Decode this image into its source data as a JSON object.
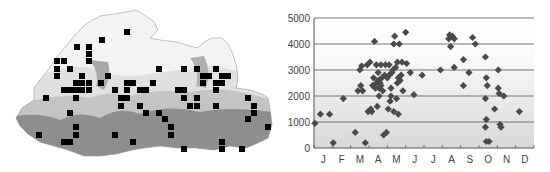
{
  "figure": {
    "left_panel": "Distribution map with grid-square occurrence records over elevation relief",
    "right_panel": "Scatter plot of altitude vs month"
  },
  "map": {
    "relief_colors": {
      "low": "#8a8a8a",
      "mid": "#bdbdbd",
      "high": "#e6e6e6",
      "outline": "#9a9a9a"
    },
    "marker_color": "#000000",
    "markers": [
      [
        127,
        32
      ],
      [
        102,
        40
      ],
      [
        77,
        47
      ],
      [
        89,
        47
      ],
      [
        89,
        54
      ],
      [
        89,
        61
      ],
      [
        57,
        61
      ],
      [
        64,
        61
      ],
      [
        57,
        69
      ],
      [
        70,
        69
      ],
      [
        57,
        76
      ],
      [
        82,
        76
      ],
      [
        108,
        76
      ],
      [
        159,
        69
      ],
      [
        184,
        69
      ],
      [
        197,
        69
      ],
      [
        216,
        69
      ],
      [
        82,
        83
      ],
      [
        76,
        83
      ],
      [
        89,
        83
      ],
      [
        101,
        83
      ],
      [
        127,
        83
      ],
      [
        133,
        83
      ],
      [
        153,
        83
      ],
      [
        203,
        83
      ],
      [
        216,
        83
      ],
      [
        222,
        83
      ],
      [
        222,
        76
      ],
      [
        228,
        76
      ],
      [
        203,
        76
      ],
      [
        209,
        76
      ],
      [
        64,
        90
      ],
      [
        70,
        90
      ],
      [
        76,
        90
      ],
      [
        82,
        90
      ],
      [
        89,
        90
      ],
      [
        115,
        90
      ],
      [
        127,
        90
      ],
      [
        140,
        90
      ],
      [
        146,
        90
      ],
      [
        178,
        90
      ],
      [
        184,
        90
      ],
      [
        216,
        90
      ],
      [
        46,
        98
      ],
      [
        76,
        98
      ],
      [
        121,
        98
      ],
      [
        127,
        98
      ],
      [
        184,
        98
      ],
      [
        197,
        98
      ],
      [
        248,
        98
      ],
      [
        121,
        106
      ],
      [
        140,
        106
      ],
      [
        190,
        106
      ],
      [
        197,
        106
      ],
      [
        216,
        106
      ],
      [
        254,
        106
      ],
      [
        70,
        113
      ],
      [
        146,
        113
      ],
      [
        159,
        113
      ],
      [
        254,
        113
      ],
      [
        165,
        119
      ],
      [
        248,
        119
      ],
      [
        171,
        127
      ],
      [
        76,
        127
      ],
      [
        268,
        127
      ],
      [
        39,
        135
      ],
      [
        76,
        135
      ],
      [
        115,
        135
      ],
      [
        171,
        135
      ],
      [
        64,
        142
      ],
      [
        70,
        142
      ],
      [
        133,
        142
      ],
      [
        222,
        142
      ],
      [
        184,
        149
      ],
      [
        222,
        149
      ],
      [
        242,
        149
      ]
    ]
  },
  "chart_data": {
    "type": "scatter",
    "title": "",
    "xlabel": "",
    "ylabel": "",
    "categories": [
      "J",
      "F",
      "M",
      "A",
      "M",
      "J",
      "J",
      "A",
      "S",
      "O",
      "N",
      "D"
    ],
    "ylim": [
      0,
      5000
    ],
    "yticks": [
      0,
      1000,
      2000,
      3000,
      4000,
      5000
    ],
    "grid": {
      "horizontal": true,
      "vertical": false
    },
    "background": "gradient grey (lighter at top)",
    "marker": "diamond",
    "marker_color": "#4a4a4a",
    "x_unit": "month index (0 = January center)",
    "points": [
      [
        -0.45,
        950
      ],
      [
        -0.15,
        1300
      ],
      [
        0.35,
        1300
      ],
      [
        0.55,
        200
      ],
      [
        1.1,
        1900
      ],
      [
        1.75,
        600
      ],
      [
        1.9,
        2200
      ],
      [
        2.0,
        3000
      ],
      [
        2.05,
        2400
      ],
      [
        2.1,
        3150
      ],
      [
        2.15,
        2200
      ],
      [
        2.3,
        200
      ],
      [
        2.4,
        3200
      ],
      [
        2.45,
        1400
      ],
      [
        2.55,
        3300
      ],
      [
        2.6,
        1500
      ],
      [
        2.65,
        1400
      ],
      [
        2.7,
        2400
      ],
      [
        2.75,
        2700
      ],
      [
        2.8,
        4100
      ],
      [
        2.85,
        2300
      ],
      [
        2.9,
        2500
      ],
      [
        2.9,
        3200
      ],
      [
        2.95,
        1600
      ],
      [
        3.0,
        2600
      ],
      [
        3.0,
        2900
      ],
      [
        3.05,
        2000
      ],
      [
        3.05,
        2300
      ],
      [
        3.1,
        2500
      ],
      [
        3.15,
        2400
      ],
      [
        3.15,
        3200
      ],
      [
        3.2,
        2700
      ],
      [
        3.25,
        2200
      ],
      [
        3.3,
        500
      ],
      [
        3.35,
        2800
      ],
      [
        3.4,
        3200
      ],
      [
        3.45,
        600
      ],
      [
        3.5,
        2700
      ],
      [
        3.55,
        1500
      ],
      [
        3.6,
        2800
      ],
      [
        3.6,
        3200
      ],
      [
        3.65,
        1800
      ],
      [
        3.7,
        2000
      ],
      [
        3.7,
        2300
      ],
      [
        3.75,
        2900
      ],
      [
        3.8,
        3000
      ],
      [
        3.85,
        1400
      ],
      [
        3.85,
        4000
      ],
      [
        3.9,
        4300
      ],
      [
        3.95,
        3100
      ],
      [
        4.0,
        1900
      ],
      [
        4.05,
        3300
      ],
      [
        4.05,
        2500
      ],
      [
        4.1,
        2700
      ],
      [
        4.1,
        1300
      ],
      [
        4.15,
        4000
      ],
      [
        4.2,
        2600
      ],
      [
        4.25,
        2800
      ],
      [
        4.3,
        3300
      ],
      [
        4.35,
        2200
      ],
      [
        4.5,
        4450
      ],
      [
        4.55,
        3250
      ],
      [
        4.75,
        2900
      ],
      [
        4.95,
        2050
      ],
      [
        5.4,
        2800
      ],
      [
        6.4,
        3000
      ],
      [
        6.85,
        4200
      ],
      [
        6.9,
        4350
      ],
      [
        6.95,
        3900
      ],
      [
        7.05,
        4300
      ],
      [
        7.15,
        4200
      ],
      [
        7.15,
        3100
      ],
      [
        7.65,
        3400
      ],
      [
        7.65,
        2400
      ],
      [
        7.95,
        2900
      ],
      [
        8.15,
        4250
      ],
      [
        8.3,
        4000
      ],
      [
        8.85,
        3500
      ],
      [
        8.85,
        1900
      ],
      [
        8.85,
        800
      ],
      [
        8.9,
        2700
      ],
      [
        8.9,
        1100
      ],
      [
        8.9,
        250
      ],
      [
        8.95,
        2400
      ],
      [
        9.05,
        250
      ],
      [
        9.35,
        1500
      ],
      [
        9.55,
        3000
      ],
      [
        9.55,
        2300
      ],
      [
        9.6,
        2100
      ],
      [
        9.65,
        900
      ],
      [
        9.7,
        800
      ],
      [
        9.85,
        2000
      ],
      [
        10.7,
        1400
      ]
    ]
  }
}
